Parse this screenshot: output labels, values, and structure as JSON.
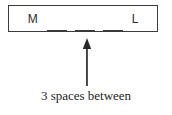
{
  "figure": {
    "word_box": {
      "start_letter": "M",
      "end_letter": "L",
      "blank_count": 3,
      "blanks": [
        "_",
        "_",
        "_"
      ]
    },
    "annotation": {
      "arrow": "up-arrow-icon",
      "caption": "3 spaces between"
    },
    "colors": {
      "box_border": "#3c3c3c",
      "ink": "#2b2b2b",
      "blank_line": "#3a3a3a",
      "arrow": "#2a2a2a",
      "caption": "#1e1e1e",
      "background": "#ffffff"
    }
  }
}
